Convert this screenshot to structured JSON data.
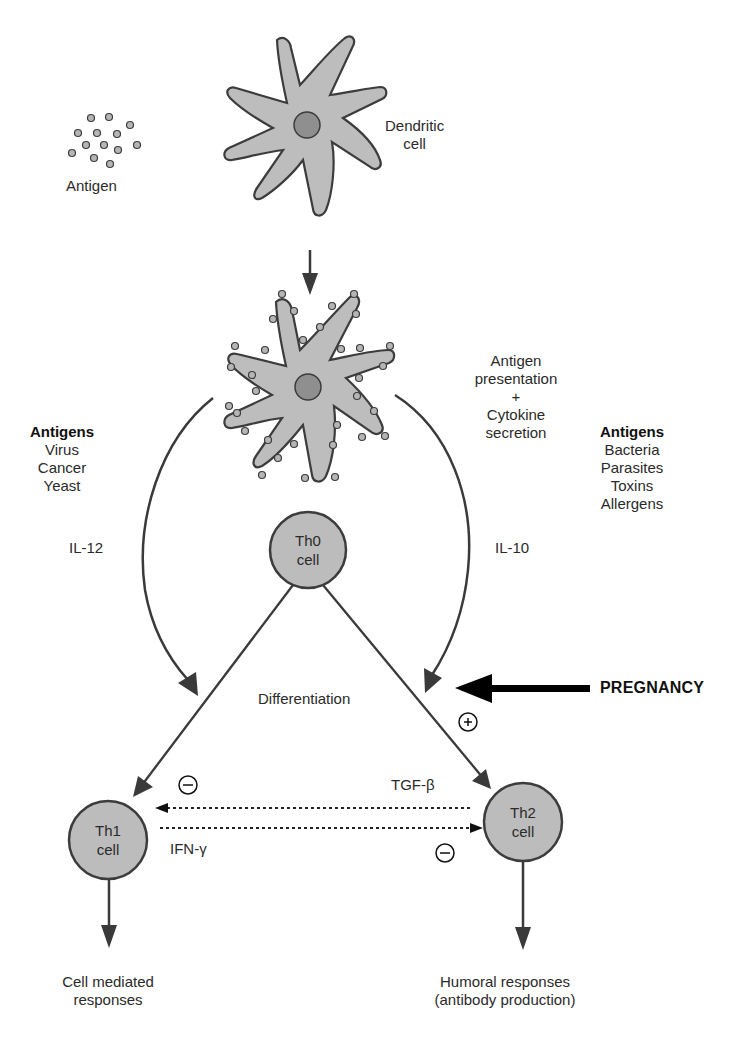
{
  "colors": {
    "cell_fill": "#b9b9b9",
    "nucleus_fill": "#8f8f8f",
    "outline": "#3c3c3c",
    "arrow": "#3a3a3a",
    "pregnancy_arrow": "#000000",
    "text": "#2a2a2a"
  },
  "antigen": {
    "label": "Antigen"
  },
  "dendritic_cell": {
    "label_line1": "Dendritic",
    "label_line2": "cell"
  },
  "presentation": {
    "line1": "Antigen",
    "line2": "presentation",
    "line3": "+",
    "line4": "Cytokine",
    "line5": "secretion"
  },
  "th1_antigens": {
    "title": "Antigens",
    "items": [
      "Virus",
      "Cancer",
      "Yeast"
    ]
  },
  "th2_antigens": {
    "title": "Antigens",
    "items": [
      "Bacteria",
      "Parasites",
      "Toxins",
      "Allergens"
    ]
  },
  "cytokines": {
    "left_arc": "IL-12",
    "right_arc": "IL-10",
    "th2_to_th1": "TGF-β",
    "th1_to_th2": "IFN-γ"
  },
  "cells": {
    "th0": {
      "line1": "Th0",
      "line2": "cell"
    },
    "th1": {
      "line1": "Th1",
      "line2": "cell"
    },
    "th2": {
      "line1": "Th2",
      "line2": "cell"
    }
  },
  "differentiation": "Differentiation",
  "pregnancy": "PREGNANCY",
  "signs": {
    "plus": "+",
    "minus": "−"
  },
  "outcomes": {
    "th1": {
      "line1": "Cell mediated",
      "line2": "responses"
    },
    "th2": {
      "line1": "Humoral responses",
      "line2": "(antibody production)"
    }
  }
}
